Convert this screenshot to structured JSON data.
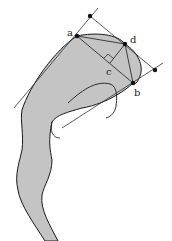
{
  "diagram": {
    "colors": {
      "fill": "#c4c4c4",
      "stroke": "#1a1a1a",
      "background": "#ffffff"
    },
    "points": {
      "a": {
        "label": "a",
        "x": 77,
        "y": 36
      },
      "b": {
        "label": "b",
        "x": 133,
        "y": 83
      },
      "c": {
        "label": "c",
        "x": 110,
        "y": 63
      },
      "d": {
        "label": "d",
        "x": 125,
        "y": 44
      },
      "top": {
        "x": 90,
        "y": 16
      },
      "right": {
        "x": 155,
        "y": 70
      }
    },
    "annotations": [
      "right-angle-marker at c"
    ]
  }
}
